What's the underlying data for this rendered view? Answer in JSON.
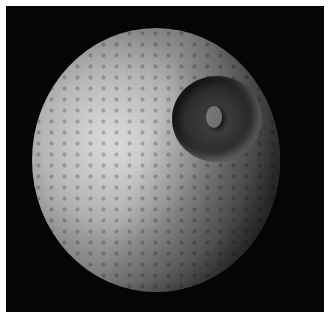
{
  "image": {
    "subject": "cratered-moon",
    "features": [
      "large-impact-crater",
      "central-peak",
      "cratered-surface",
      "black-space-background"
    ],
    "colors": {
      "border": "#ffffff",
      "background": "#050505",
      "surface_light": "#c9c9c9",
      "surface_mid": "#8a8a8a",
      "crater_floor": "#3d3d3d"
    }
  }
}
